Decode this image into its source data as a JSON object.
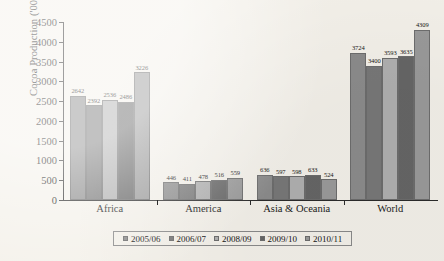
{
  "chart_data": {
    "type": "bar",
    "title": "",
    "xlabel": "",
    "ylabel": "Cocoa Production ('000' tonnes)",
    "ylim": [
      0,
      4500
    ],
    "ytick_step": 500,
    "yticks": [
      "4500",
      "4000",
      "3500",
      "3000",
      "2500",
      "2000",
      "1500",
      "1000",
      "500",
      "0"
    ],
    "grid": false,
    "legend_position": "bottom",
    "categories": [
      "Africa",
      "America",
      "Asia & Oceania",
      "World"
    ],
    "series": [
      {
        "name": "2005/06",
        "color": "#8c8c8c",
        "values": [
          2642,
          446,
          636,
          3724
        ]
      },
      {
        "name": "2006/07",
        "color": "#787878",
        "values": [
          2392,
          411,
          597,
          3400
        ]
      },
      {
        "name": "2008/09",
        "color": "#b0b0b0",
        "values": [
          2536,
          478,
          598,
          3593
        ]
      },
      {
        "name": "2009/10",
        "color": "#666666",
        "values": [
          2486,
          516,
          633,
          3635
        ]
      },
      {
        "name": "2010/11",
        "color": "#9a9a9a",
        "values": [
          3226,
          559,
          524,
          4309
        ]
      }
    ]
  },
  "axis": {
    "y_title": "Cocoa Production ('000' tonnes)"
  }
}
